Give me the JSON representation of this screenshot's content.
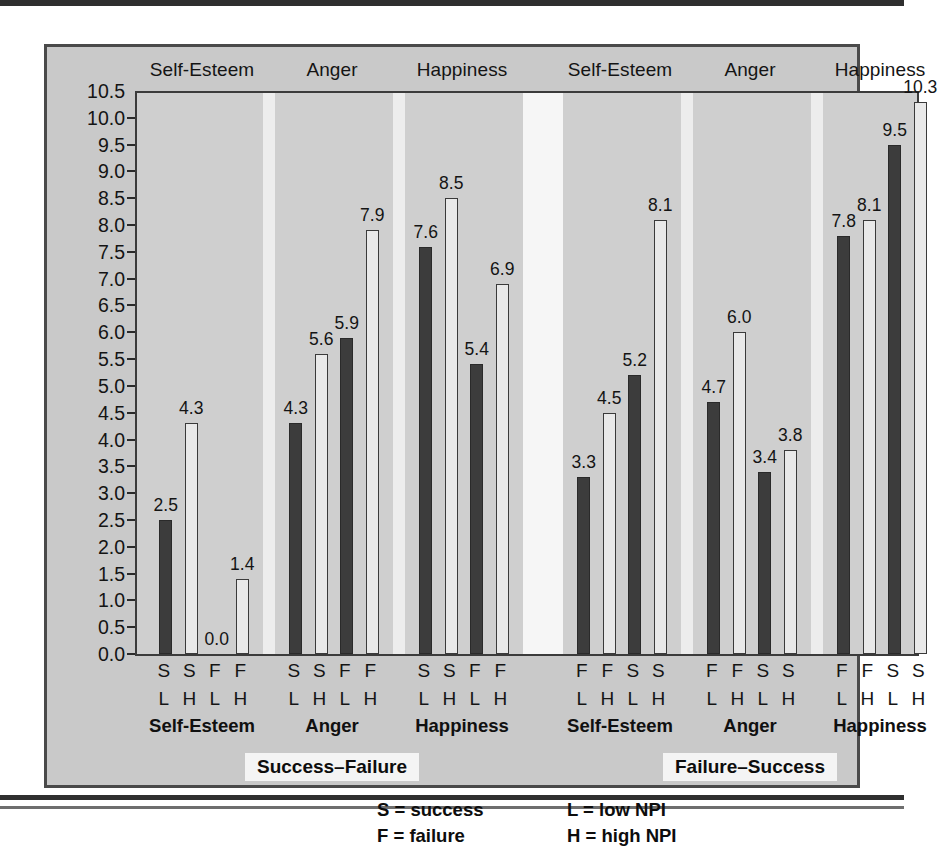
{
  "chart_data": {
    "type": "bar",
    "title": "",
    "xlabel": "",
    "ylabel": "",
    "ylim": [
      0.0,
      10.5
    ],
    "grid": false,
    "legend_position": "bottom",
    "y_ticks": [
      "10.5",
      "10.0",
      "9.5",
      "9.0",
      "8.5",
      "8.0",
      "7.5",
      "7.0",
      "6.5",
      "6.0",
      "5.5",
      "5.0",
      "4.5",
      "4.0",
      "3.5",
      "3.0",
      "2.5",
      "2.0",
      "1.5",
      "1.0",
      "0.5",
      "0.0"
    ],
    "facet_headers": [
      "Self-Esteem",
      "Anger",
      "Happiness",
      "Self-Esteem",
      "Anger",
      "Happiness"
    ],
    "measure_names": [
      "Self-Esteem",
      "Anger",
      "Happiness",
      "Self-Esteem",
      "Anger",
      "Happiness"
    ],
    "conditions": [
      "Success–Failure",
      "Failure–Success"
    ],
    "legend": [
      {
        "line": "S = success"
      },
      {
        "line": "F = failure"
      },
      {
        "line": "L = low NPI"
      },
      {
        "line": "H = high NPI"
      }
    ],
    "groups": [
      {
        "condition": "Success–Failure",
        "measure": "Self-Esteem",
        "bars": [
          {
            "outcome": "S",
            "npi": "L",
            "value": 2.5,
            "label": "2.5",
            "style": "dark"
          },
          {
            "outcome": "S",
            "npi": "H",
            "value": 4.3,
            "label": "4.3",
            "style": "light"
          },
          {
            "outcome": "F",
            "npi": "L",
            "value": 0.0,
            "label": "0.0",
            "style": "dark"
          },
          {
            "outcome": "F",
            "npi": "H",
            "value": 1.4,
            "label": "1.4",
            "style": "light"
          }
        ]
      },
      {
        "condition": "Success–Failure",
        "measure": "Anger",
        "bars": [
          {
            "outcome": "S",
            "npi": "L",
            "value": 4.3,
            "label": "4.3",
            "style": "dark"
          },
          {
            "outcome": "S",
            "npi": "H",
            "value": 5.6,
            "label": "5.6",
            "style": "light"
          },
          {
            "outcome": "F",
            "npi": "L",
            "value": 5.9,
            "label": "5.9",
            "style": "dark"
          },
          {
            "outcome": "F",
            "npi": "H",
            "value": 7.9,
            "label": "7.9",
            "style": "light"
          }
        ]
      },
      {
        "condition": "Success–Failure",
        "measure": "Happiness",
        "bars": [
          {
            "outcome": "S",
            "npi": "L",
            "value": 7.6,
            "label": "7.6",
            "style": "dark"
          },
          {
            "outcome": "S",
            "npi": "H",
            "value": 8.5,
            "label": "8.5",
            "style": "light"
          },
          {
            "outcome": "F",
            "npi": "L",
            "value": 5.4,
            "label": "5.4",
            "style": "dark"
          },
          {
            "outcome": "F",
            "npi": "H",
            "value": 6.9,
            "label": "6.9",
            "style": "light"
          }
        ]
      },
      {
        "condition": "Failure–Success",
        "measure": "Self-Esteem",
        "bars": [
          {
            "outcome": "F",
            "npi": "L",
            "value": 3.3,
            "label": "3.3",
            "style": "dark"
          },
          {
            "outcome": "F",
            "npi": "H",
            "value": 4.5,
            "label": "4.5",
            "style": "light"
          },
          {
            "outcome": "S",
            "npi": "L",
            "value": 5.2,
            "label": "5.2",
            "style": "dark"
          },
          {
            "outcome": "S",
            "npi": "H",
            "value": 8.1,
            "label": "8.1",
            "style": "light"
          }
        ]
      },
      {
        "condition": "Failure–Success",
        "measure": "Anger",
        "bars": [
          {
            "outcome": "F",
            "npi": "L",
            "value": 4.7,
            "label": "4.7",
            "style": "dark"
          },
          {
            "outcome": "F",
            "npi": "H",
            "value": 6.0,
            "label": "6.0",
            "style": "light"
          },
          {
            "outcome": "S",
            "npi": "L",
            "value": 3.4,
            "label": "3.4",
            "style": "dark"
          },
          {
            "outcome": "S",
            "npi": "H",
            "value": 3.8,
            "label": "3.8",
            "style": "light"
          }
        ]
      },
      {
        "condition": "Failure–Success",
        "measure": "Happiness",
        "bars": [
          {
            "outcome": "F",
            "npi": "L",
            "value": 7.8,
            "label": "7.8",
            "style": "dark"
          },
          {
            "outcome": "F",
            "npi": "H",
            "value": 8.1,
            "label": "8.1",
            "style": "light"
          },
          {
            "outcome": "S",
            "npi": "L",
            "value": 9.5,
            "label": "9.5",
            "style": "dark"
          },
          {
            "outcome": "S",
            "npi": "H",
            "value": 10.3,
            "label": "10.3",
            "style": "light"
          }
        ]
      }
    ]
  }
}
